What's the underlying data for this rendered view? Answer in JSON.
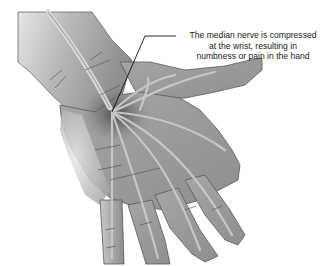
{
  "figure": {
    "annotation": {
      "lines": [
        "The median nerve is compressed",
        "at the wrist, resulting in",
        "numbness or pain in the hand"
      ]
    },
    "colors": {
      "background": "#ffffff",
      "palm_skin": "#9a9a9a",
      "forearm_skin": "#c8c8c8",
      "outline": "#555555",
      "nerve": "#c4c4c4",
      "compression_shadow": "#5a5a5a",
      "callout_line": "#111111"
    }
  }
}
